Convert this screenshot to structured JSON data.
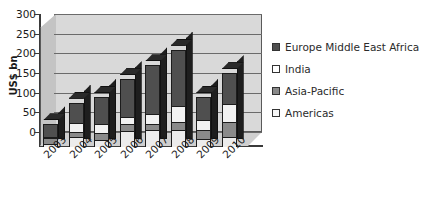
{
  "chart_data": {
    "type": "bar",
    "subtype": "stacked-column-3d",
    "title": "",
    "xlabel": "",
    "ylabel": "US$ bn",
    "ylim": [
      0,
      300
    ],
    "ytick_values": [
      0,
      50,
      100,
      150,
      200,
      250,
      300
    ],
    "ytick_labels": [
      "0",
      "50",
      "100",
      "150",
      "200",
      "250",
      "300"
    ],
    "grid": true,
    "legend_position": "right",
    "categories": [
      "2003",
      "2004",
      "2005",
      "2006",
      "2007",
      "2008",
      "2009",
      "2010"
    ],
    "stack_order_bottom_to_top": [
      "Americas",
      "Asia-Pacific",
      "India",
      "Europe Middle East Africa"
    ],
    "series": [
      {
        "name": "Americas",
        "color": "#ececec",
        "values": [
          8,
          25,
          18,
          40,
          42,
          42,
          20,
          25
        ]
      },
      {
        "name": "Asia-Pacific",
        "color": "#8a8a8a",
        "values": [
          17,
          17,
          20,
          20,
          20,
          25,
          25,
          40
        ]
      },
      {
        "name": "India",
        "color": "#f2f2f2",
        "values": [
          5,
          23,
          25,
          22,
          26,
          43,
          30,
          50
        ]
      },
      {
        "name": "Europe Middle East Africa",
        "color": "#4f4f4f",
        "values": [
          35,
          55,
          72,
          98,
          127,
          145,
          60,
          80
        ]
      }
    ],
    "totals": [
      65,
      120,
      135,
      180,
      215,
      255,
      135,
      195
    ]
  },
  "legend": {
    "items": [
      {
        "label": "Europe Middle East Africa",
        "swatch": "#4f4f4f"
      },
      {
        "label": "India",
        "swatch": "#ffffff"
      },
      {
        "label": "Asia-Pacific",
        "swatch": "#8a8a8a"
      },
      {
        "label": "Americas",
        "swatch": "#f7f7f7"
      }
    ]
  },
  "axes": {
    "y_title": "US$ bn"
  }
}
